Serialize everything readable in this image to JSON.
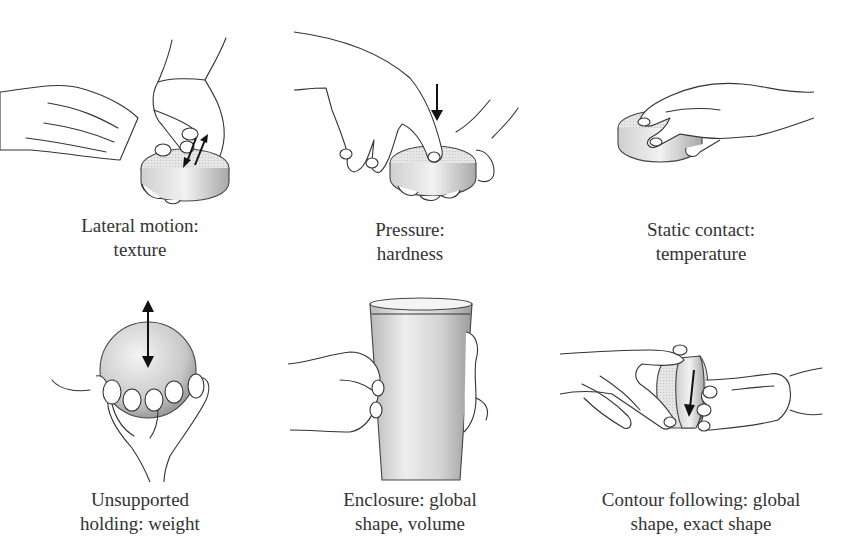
{
  "figure": {
    "panels": [
      {
        "id": "lateral-motion",
        "caption_line1": "Lateral motion:",
        "caption_line2": "texture",
        "icon": "hand-rubbing-disc-with-double-arrow"
      },
      {
        "id": "pressure",
        "caption_line1": "Pressure:",
        "caption_line2": "hardness",
        "icon": "finger-pressing-disc-with-down-arrow"
      },
      {
        "id": "static-contact",
        "caption_line1": "Static contact:",
        "caption_line2": "temperature",
        "icon": "hand-resting-on-disc"
      },
      {
        "id": "unsupported-holding",
        "caption_line1": "Unsupported",
        "caption_line2": "holding: weight",
        "icon": "hand-holding-sphere-with-up-down-arrow"
      },
      {
        "id": "enclosure",
        "caption_line1": "Enclosure: global",
        "caption_line2": "shape, volume",
        "icon": "hands-enclosing-cup"
      },
      {
        "id": "contour-following",
        "caption_line1": "Contour following: global",
        "caption_line2": "shape, exact shape",
        "icon": "fingers-tracing-disc-edge-with-arrow"
      }
    ],
    "colors": {
      "line": "#333333",
      "object_light": "#e4e4e4",
      "object_dark": "#9a9a9a",
      "arrow": "#111111",
      "background": "#ffffff"
    }
  }
}
